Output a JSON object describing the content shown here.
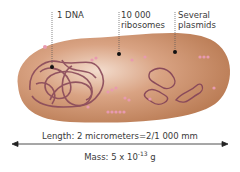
{
  "labels": {
    "dna": "1 DNA",
    "ribosomes_line1": "10 000",
    "ribosomes_line2": "ribosomes",
    "plasmids_line1": "Several",
    "plasmids_line2": "plasmids"
  },
  "caption": {
    "length": "Length: 2 micrometers=2/1 000 mm",
    "mass_prefix": "Mass: 5 x 10",
    "mass_exponent": "-13",
    "mass_unit": " g"
  },
  "colors": {
    "cell_fill": "#c98d68",
    "cell_light": "#f2d9c9",
    "dna_stroke": "#8a4a5a",
    "ribosome": "#e89ab0",
    "text": "#3a3a3a"
  }
}
